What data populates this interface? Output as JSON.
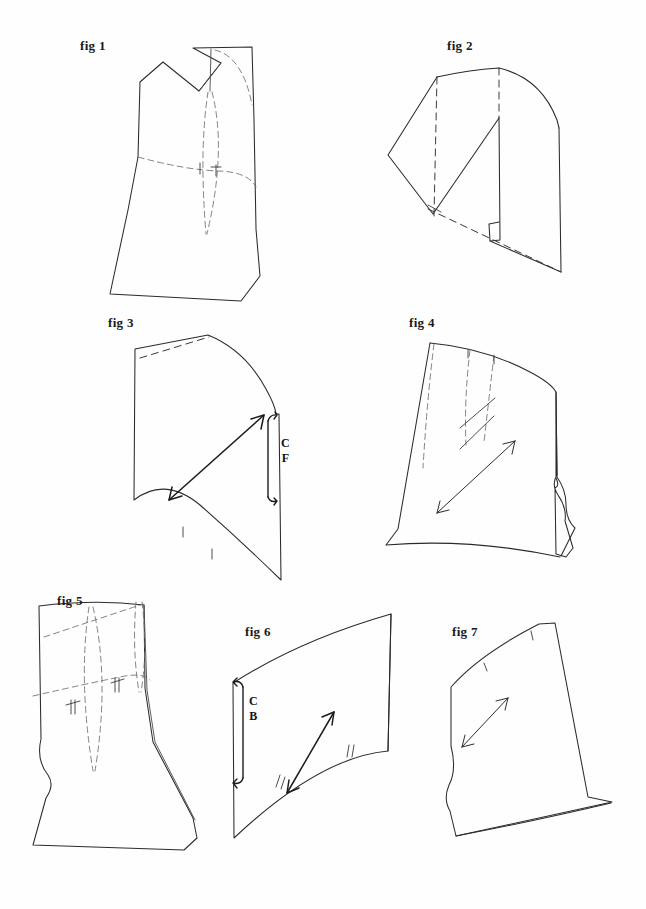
{
  "document": {
    "kind": "sewing-pattern-illustration",
    "background_color": "#fefefe",
    "ink_color": "#2b2b2b",
    "dash_color": "#6e6e6e",
    "width": 646,
    "height": 909
  },
  "figures": [
    {
      "id": "fig1",
      "label": "fig 1",
      "label_x": 80,
      "label_y": 38,
      "markings": []
    },
    {
      "id": "fig2",
      "label": "fig 2",
      "label_x": 447,
      "label_y": 38,
      "markings": []
    },
    {
      "id": "fig3",
      "label": "fig 3",
      "label_x": 108,
      "label_y": 315,
      "markings": [
        "C",
        "F"
      ]
    },
    {
      "id": "fig4",
      "label": "fig 4",
      "label_x": 409,
      "label_y": 315,
      "markings": []
    },
    {
      "id": "fig5",
      "label": "fig 5",
      "label_x": 57,
      "label_y": 593,
      "markings": []
    },
    {
      "id": "fig6",
      "label": "fig 6",
      "label_x": 245,
      "label_y": 624,
      "markings": [
        "C",
        "B"
      ]
    },
    {
      "id": "fig7",
      "label": "fig 7",
      "label_x": 452,
      "label_y": 624,
      "markings": []
    }
  ],
  "annotations": {
    "centre_front": {
      "line1": "C",
      "line2": "F",
      "x": 281,
      "y": 436
    },
    "centre_back": {
      "line1": "C",
      "line2": "B",
      "x": 249,
      "y": 694
    }
  }
}
